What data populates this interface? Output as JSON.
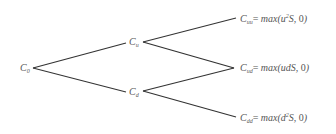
{
  "diagram": {
    "type": "binomial-tree",
    "line_color": "#333333",
    "text_color": "#555555",
    "nodes": {
      "root": {
        "base": "C",
        "sub": "0"
      },
      "up": {
        "base": "C",
        "sub": "u"
      },
      "down": {
        "base": "C",
        "sub": "d"
      },
      "uu": {
        "base": "C",
        "sub": "uu",
        "eq": "= ",
        "fn": "max(",
        "arg_pre": "u",
        "arg_sup": "2",
        "arg_post": "S, ",
        "zero": "0",
        "close": ")"
      },
      "ud": {
        "base": "C",
        "sub": "ud",
        "eq": "= ",
        "fn": "max(",
        "arg_pre": "udS",
        "arg_sup": "",
        "arg_post": ", ",
        "zero": "0",
        "close": ")"
      },
      "dd": {
        "base": "C",
        "sub": "dd",
        "eq": "= ",
        "fn": "max(",
        "arg_pre": "d",
        "arg_sup": "2",
        "arg_post": "S, ",
        "zero": "0",
        "close": ")"
      }
    },
    "edges": [
      [
        "root",
        "up"
      ],
      [
        "root",
        "down"
      ],
      [
        "up",
        "uu"
      ],
      [
        "up",
        "ud"
      ],
      [
        "down",
        "ud"
      ],
      [
        "down",
        "dd"
      ]
    ]
  }
}
